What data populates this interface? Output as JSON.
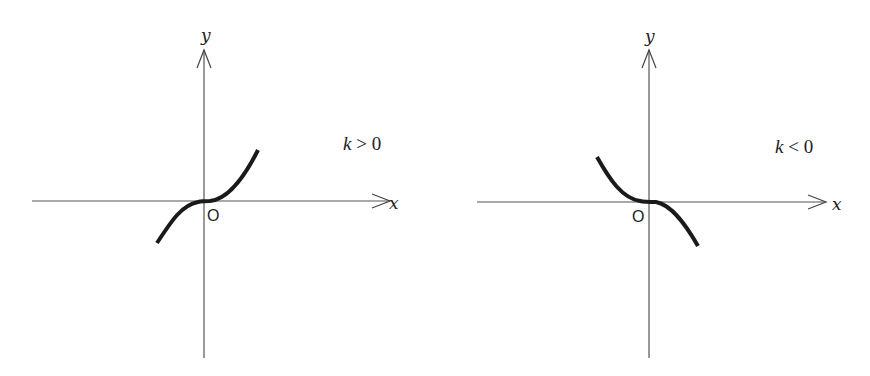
{
  "figure": {
    "panels": [
      {
        "id": "left",
        "x_axis_label": "x",
        "y_axis_label": "y",
        "origin_label": "O",
        "condition_label": "k > 0",
        "condition_var": "k",
        "condition_op_value": " > 0",
        "curve_shape": "increasing cubic y = kx^3"
      },
      {
        "id": "right",
        "x_axis_label": "x",
        "y_axis_label": "y",
        "origin_label": "O",
        "condition_label": "k < 0",
        "condition_var": "k",
        "condition_op_value": " < 0",
        "curve_shape": "decreasing cubic y = kx^3"
      }
    ],
    "colors": {
      "background": "#ffffff",
      "axis": "#555555",
      "curve": "#1a1a1a",
      "text": "#222222"
    }
  }
}
